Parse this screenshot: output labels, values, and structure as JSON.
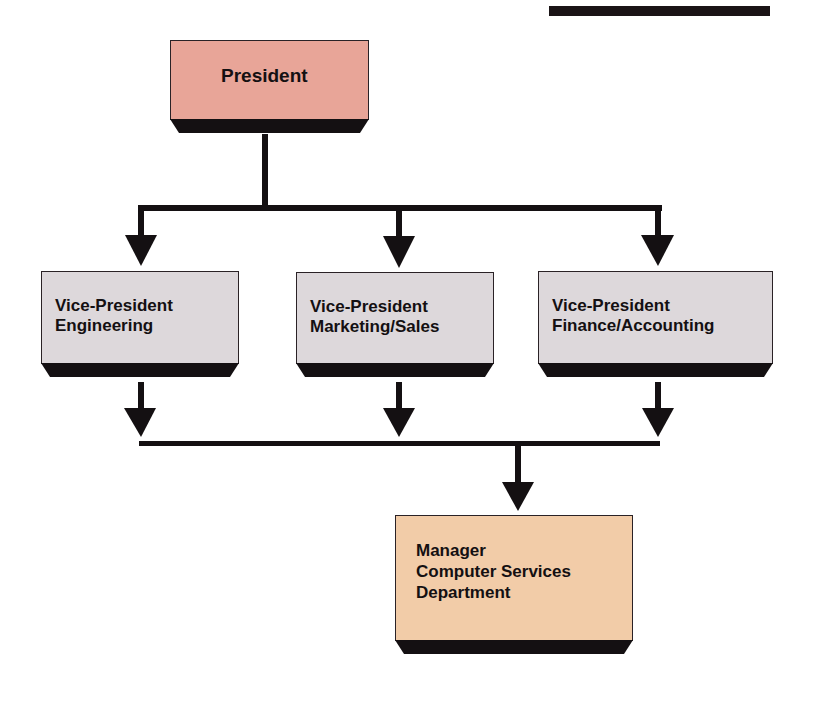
{
  "diagram": {
    "type": "org-chart",
    "colors": {
      "president_fill": "#E8A598",
      "vp_fill": "#DDD8DB",
      "manager_fill": "#F2CCA8",
      "line": "#141012"
    },
    "nodes": {
      "president": {
        "line1": "President"
      },
      "vp_engineering": {
        "line1": "Vice-President",
        "line2": "Engineering"
      },
      "vp_marketing": {
        "line1": "Vice-President",
        "line2": "Marketing/Sales"
      },
      "vp_finance": {
        "line1": "Vice-President",
        "line2": "Finance/Accounting"
      },
      "manager": {
        "line1": "Manager",
        "line2": "Computer Services",
        "line3": "Department"
      }
    },
    "edges": [
      {
        "from": "President",
        "to": "Vice-President Engineering"
      },
      {
        "from": "President",
        "to": "Vice-President Marketing/Sales"
      },
      {
        "from": "President",
        "to": "Vice-President Finance/Accounting"
      },
      {
        "from": "Vice-President Engineering",
        "to": "Manager Computer Services Department"
      },
      {
        "from": "Vice-President Marketing/Sales",
        "to": "Manager Computer Services Department"
      },
      {
        "from": "Vice-President Finance/Accounting",
        "to": "Manager Computer Services Department"
      }
    ]
  }
}
